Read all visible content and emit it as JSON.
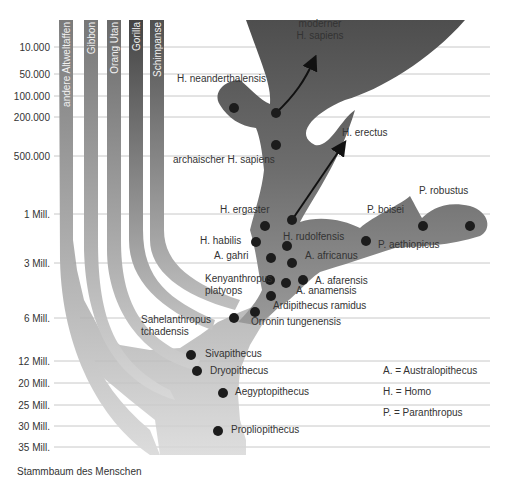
{
  "time_axis": {
    "ticks": [
      {
        "label": "10.000",
        "y": 47
      },
      {
        "label": "50.000",
        "y": 74
      },
      {
        "label": "100.000",
        "y": 96
      },
      {
        "label": "200.000",
        "y": 117
      },
      {
        "label": "500.000",
        "y": 156
      },
      {
        "label": "1 Mill.",
        "y": 214
      },
      {
        "label": "3 Mill.",
        "y": 263
      },
      {
        "label": "6 Mill.",
        "y": 318
      },
      {
        "label": "12 Mill.",
        "y": 361
      },
      {
        "label": "20 Mill.",
        "y": 383
      },
      {
        "label": "25 Mill.",
        "y": 405
      },
      {
        "label": "30 Mill.",
        "y": 426
      },
      {
        "label": "35 Mill.",
        "y": 447
      }
    ]
  },
  "lineages": [
    {
      "label": "andere Altweltaffen",
      "x": 66
    },
    {
      "label": "Gibbon",
      "x": 91
    },
    {
      "label": "Orang Utan",
      "x": 114
    },
    {
      "label": "Gorilla",
      "x": 136
    },
    {
      "label": "Schimpanse",
      "x": 157
    }
  ],
  "species": [
    {
      "label": "moderner",
      "x": 320,
      "y": 27,
      "anchor": "middle"
    },
    {
      "label": "H. sapiens",
      "x": 320,
      "y": 39,
      "anchor": "middle"
    },
    {
      "label": "H. neanderthalensis",
      "x": 177,
      "y": 82,
      "anchor": "start"
    },
    {
      "label": "H. erectus",
      "x": 342,
      "y": 136,
      "anchor": "start"
    },
    {
      "label": "archaischer H. sapiens",
      "x": 173,
      "y": 163,
      "anchor": "start"
    },
    {
      "label": "P. robustus",
      "x": 419,
      "y": 194,
      "anchor": "start"
    },
    {
      "label": "H. ergaster",
      "x": 220,
      "y": 213,
      "anchor": "start"
    },
    {
      "label": "P. boisei",
      "x": 367,
      "y": 213,
      "anchor": "start"
    },
    {
      "label": "H. rudolfensis",
      "x": 283,
      "y": 240,
      "anchor": "start"
    },
    {
      "label": "H. habilis",
      "x": 200,
      "y": 244,
      "anchor": "start"
    },
    {
      "label": "P. aethiopicus",
      "x": 378,
      "y": 248,
      "anchor": "start"
    },
    {
      "label": "A. gahri",
      "x": 214,
      "y": 259,
      "anchor": "start"
    },
    {
      "label": "A. africanus",
      "x": 305,
      "y": 259,
      "anchor": "start"
    },
    {
      "label": "Kenyanthropus",
      "x": 205,
      "y": 282,
      "anchor": "start"
    },
    {
      "label": "platyops",
      "x": 205,
      "y": 294,
      "anchor": "start"
    },
    {
      "label": "A. afarensis",
      "x": 315,
      "y": 284,
      "anchor": "start"
    },
    {
      "label": "A. anamensis",
      "x": 296,
      "y": 294,
      "anchor": "start"
    },
    {
      "label": "Ardipithecus ramidus",
      "x": 273,
      "y": 309,
      "anchor": "start"
    },
    {
      "label": "Sahelanthropus",
      "x": 141,
      "y": 323,
      "anchor": "start"
    },
    {
      "label": "tchadensis",
      "x": 141,
      "y": 335,
      "anchor": "start"
    },
    {
      "label": "Orronin tungenensis",
      "x": 251,
      "y": 325,
      "anchor": "start"
    },
    {
      "label": "Sivapithecus",
      "x": 205,
      "y": 357,
      "anchor": "start"
    },
    {
      "label": "Dryopithecus",
      "x": 210,
      "y": 374,
      "anchor": "start"
    },
    {
      "label": "Aegyptopithecus",
      "x": 235,
      "y": 395,
      "anchor": "start"
    },
    {
      "label": "Propliopithecus",
      "x": 231,
      "y": 433,
      "anchor": "start"
    }
  ],
  "fossil_points": [
    {
      "x": 234,
      "y": 108
    },
    {
      "x": 276,
      "y": 113
    },
    {
      "x": 276,
      "y": 145
    },
    {
      "x": 292,
      "y": 220
    },
    {
      "x": 265,
      "y": 226
    },
    {
      "x": 256,
      "y": 242
    },
    {
      "x": 287,
      "y": 246
    },
    {
      "x": 271,
      "y": 258
    },
    {
      "x": 292,
      "y": 263
    },
    {
      "x": 270,
      "y": 280
    },
    {
      "x": 286,
      "y": 283
    },
    {
      "x": 303,
      "y": 280
    },
    {
      "x": 271,
      "y": 296
    },
    {
      "x": 255,
      "y": 312
    },
    {
      "x": 234,
      "y": 318
    },
    {
      "x": 366,
      "y": 241
    },
    {
      "x": 423,
      "y": 226
    },
    {
      "x": 470,
      "y": 226
    },
    {
      "x": 191,
      "y": 355
    },
    {
      "x": 197,
      "y": 371
    },
    {
      "x": 223,
      "y": 393
    },
    {
      "x": 218,
      "y": 431
    }
  ],
  "legend": [
    {
      "label": "A. = Australopithecus",
      "y": 374
    },
    {
      "label": "H. = Homo",
      "y": 395
    },
    {
      "label": "P. = Paranthropus",
      "y": 416
    }
  ],
  "footer": {
    "text": "Stammbaum des Menschen"
  },
  "colors": {
    "grid": "#c8c8c8",
    "dot": "#1c1c1c",
    "homo_dark": "#555555",
    "branch_mid": "#8a8a8a",
    "base_light": "#d4d4d4"
  }
}
